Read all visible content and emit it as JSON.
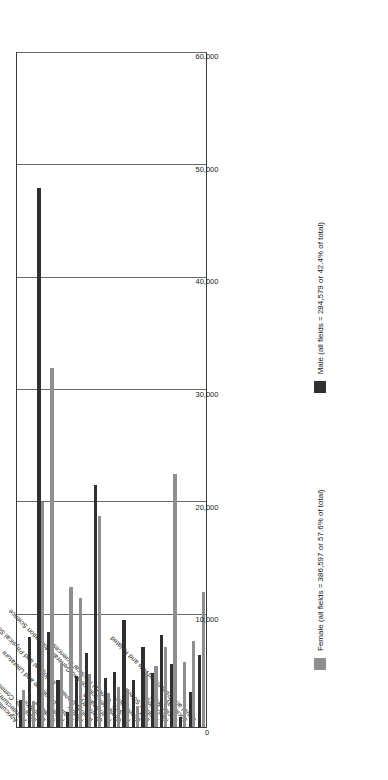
{
  "chart_data": {
    "type": "bar",
    "orientation": "horizontal",
    "title": "",
    "xlabel": "",
    "ylabel": "",
    "xlim": [
      0,
      60000
    ],
    "grid": true,
    "legend_position": "bottom",
    "tick_labels": [
      "0",
      "10,000",
      "20,000",
      "30,000",
      "40,000",
      "50,000",
      "60,000"
    ],
    "tick_values": [
      0,
      10000,
      20000,
      30000,
      40000,
      50000,
      60000
    ],
    "categories": [
      "Agriculture and Related",
      "Architecture, Engineering and Related",
      "Business, Commerce General",
      "Education",
      "Medicine",
      "Nursing",
      "English Language and Literature",
      "History",
      "Biology General, Biological and Physical Sciences",
      "Chemistry",
      "Mathematics",
      "Computer Science and General Information Science",
      "Physics, General Physical Sciences",
      "Economics",
      "Law",
      "Political Science",
      "Psychology",
      "Social Work",
      "Sociology",
      "Visual and Performing Arts and Related"
    ],
    "series": [
      {
        "name": "Male (all fields = 284,579 or 42.4% of total)",
        "color": "#2f2f2f",
        "values": [
          2400,
          8000,
          48000,
          8500,
          4200,
          1300,
          4500,
          6600,
          21500,
          4400,
          4900,
          9500,
          4200,
          7100,
          4800,
          8200,
          5600,
          900,
          3100,
          6400
        ]
      },
      {
        "name": "Female (all fields = 386,597 or 57.6% of total)",
        "color": "#8f8f8f",
        "values": [
          3300,
          2300,
          20000,
          32000,
          5700,
          12500,
          11500,
          4700,
          18800,
          3000,
          3600,
          3400,
          1900,
          4900,
          5400,
          7100,
          22500,
          5800,
          7700,
          12000
        ]
      }
    ]
  },
  "legend": {
    "male_label": "Male (all fields = 284,579 or 42.4% of total)",
    "female_label": "Female (all fields = 386,597 or 57.6% of total)"
  }
}
